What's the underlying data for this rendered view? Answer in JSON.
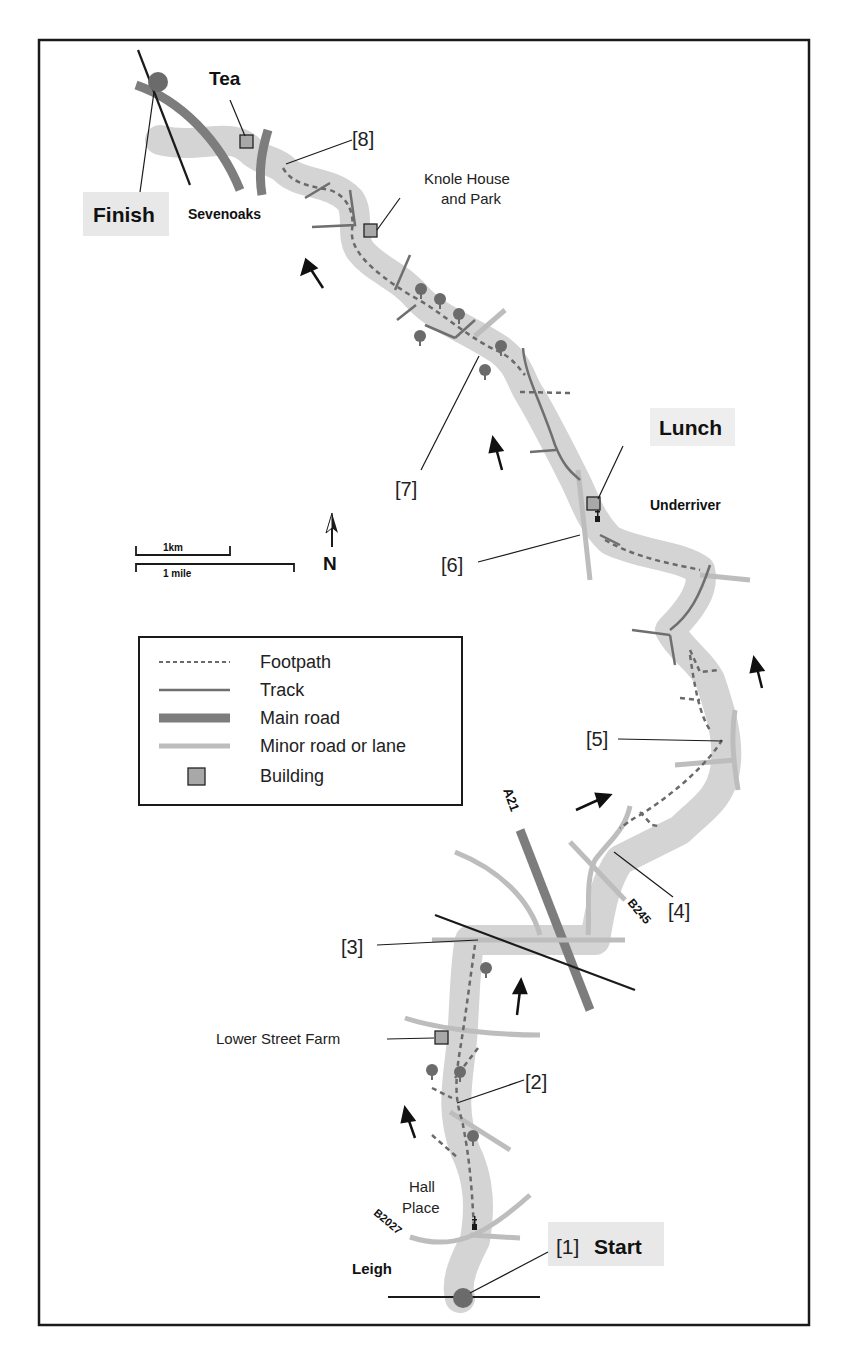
{
  "map": {
    "colors": {
      "route_band": "#d4d4d4",
      "footpath": "#6a6a6a",
      "track": "#6f6f6f",
      "main_road": "#7d7d7d",
      "minor_road": "#bdbdbd",
      "building": "#a8a8a8",
      "marker": "#6b6b6b",
      "highlight_box": "#e8e8e8",
      "frame": "#1a1a1a"
    },
    "places": {
      "finish": "Finish",
      "tea": "Tea",
      "sevenoaks": "Sevenoaks",
      "knole_line1": "Knole House",
      "knole_line2": "and Park",
      "lunch": "Lunch",
      "underriver": "Underriver",
      "lower_street_farm": "Lower Street Farm",
      "hall_line1": "Hall",
      "hall_line2": "Place",
      "leigh": "Leigh",
      "start_num": "[1]",
      "start": "Start"
    },
    "waypoints": {
      "w2": "[2]",
      "w3": "[3]",
      "w4": "[4]",
      "w5": "[5]",
      "w6": "[6]",
      "w7": "[7]",
      "w8": "[8]"
    },
    "roads": {
      "a21": "A21",
      "b245": "B245",
      "b2027": "B2027"
    },
    "scale": {
      "km": "1km",
      "mile": "1 mile"
    },
    "north": "N",
    "legend": {
      "items": [
        {
          "symbol": "footpath-dashed",
          "label": "Footpath"
        },
        {
          "symbol": "track-line",
          "label": "Track"
        },
        {
          "symbol": "main-road-thick",
          "label": "Main road"
        },
        {
          "symbol": "minor-road-light",
          "label": "Minor road or lane"
        },
        {
          "symbol": "building-square",
          "label": "Building"
        }
      ]
    }
  }
}
